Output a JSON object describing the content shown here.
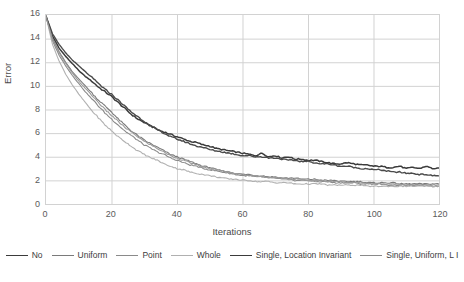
{
  "chart_data": {
    "type": "line",
    "title": "",
    "xlabel": "Iterations",
    "ylabel": "Error",
    "xlim": [
      0,
      120
    ],
    "ylim": [
      0,
      16
    ],
    "xticks": [
      0,
      20,
      40,
      60,
      80,
      100,
      120
    ],
    "yticks": [
      0,
      2,
      4,
      6,
      8,
      10,
      12,
      14,
      16
    ],
    "grid": "horizontal-and-vertical",
    "legend_position": "bottom",
    "x": [
      0,
      2,
      4,
      6,
      8,
      10,
      12,
      14,
      16,
      18,
      20,
      22,
      24,
      26,
      28,
      30,
      32,
      34,
      36,
      38,
      40,
      42,
      44,
      46,
      48,
      50,
      52,
      54,
      56,
      58,
      60,
      62,
      64,
      66,
      68,
      70,
      72,
      74,
      76,
      78,
      80,
      82,
      84,
      86,
      88,
      90,
      92,
      94,
      96,
      98,
      100,
      102,
      104,
      106,
      108,
      110,
      112,
      114,
      116,
      118,
      120
    ],
    "series": [
      {
        "name": "No",
        "color": "#3b3b3b",
        "width": 1.5,
        "values": [
          15.9,
          14.2,
          13.2,
          12.5,
          11.9,
          11.3,
          10.8,
          10.4,
          9.9,
          9.5,
          9.1,
          8.6,
          8.1,
          7.6,
          7.2,
          6.9,
          6.6,
          6.3,
          6.1,
          5.9,
          5.7,
          5.5,
          5.3,
          5.2,
          5.0,
          4.9,
          4.7,
          4.6,
          4.5,
          4.4,
          4.3,
          4.2,
          4.1,
          4.3,
          4.0,
          4.1,
          3.9,
          4.0,
          3.8,
          3.8,
          3.7,
          3.7,
          3.6,
          3.5,
          3.4,
          3.4,
          3.5,
          3.4,
          3.3,
          3.3,
          3.2,
          3.2,
          3.1,
          3.1,
          3.2,
          3.0,
          3.1,
          3.0,
          3.2,
          3.0,
          3.0
        ]
      },
      {
        "name": "Uniform",
        "color": "#7a7a7a",
        "width": 1.1,
        "values": [
          15.9,
          14.0,
          12.9,
          12.0,
          11.2,
          10.6,
          10.0,
          9.4,
          8.8,
          8.3,
          7.8,
          7.2,
          6.7,
          6.2,
          5.8,
          5.4,
          5.1,
          4.8,
          4.5,
          4.2,
          4.0,
          3.8,
          3.6,
          3.4,
          3.2,
          3.1,
          2.9,
          2.8,
          2.7,
          2.6,
          2.5,
          2.5,
          2.4,
          2.4,
          2.3,
          2.3,
          2.2,
          2.2,
          2.2,
          2.1,
          2.1,
          2.1,
          2.0,
          2.0,
          2.0,
          1.9,
          1.9,
          1.9,
          1.9,
          1.8,
          1.8,
          1.8,
          1.8,
          1.8,
          1.7,
          1.7,
          1.7,
          1.7,
          1.7,
          1.7,
          1.7
        ]
      },
      {
        "name": "Point",
        "color": "#8a8a8a",
        "width": 1.1,
        "values": [
          15.9,
          13.8,
          12.6,
          11.7,
          10.9,
          10.2,
          9.5,
          8.9,
          8.3,
          7.7,
          7.2,
          6.7,
          6.2,
          5.8,
          5.4,
          5.0,
          4.7,
          4.4,
          4.2,
          3.9,
          3.7,
          3.5,
          3.3,
          3.2,
          3.0,
          2.9,
          2.8,
          2.7,
          2.6,
          2.5,
          2.4,
          2.4,
          2.3,
          2.3,
          2.2,
          2.2,
          2.1,
          2.1,
          2.0,
          2.0,
          2.0,
          1.9,
          1.9,
          1.9,
          1.8,
          1.8,
          1.8,
          1.8,
          1.7,
          1.7,
          1.7,
          1.7,
          1.6,
          1.6,
          1.6,
          1.6,
          1.6,
          1.6,
          1.6,
          1.5,
          1.5
        ]
      },
      {
        "name": "Whole",
        "color": "#b0b0b0",
        "width": 1.1,
        "values": [
          15.9,
          13.5,
          12.1,
          11.0,
          10.1,
          9.3,
          8.6,
          7.9,
          7.3,
          6.7,
          6.2,
          5.7,
          5.3,
          4.9,
          4.5,
          4.2,
          3.9,
          3.7,
          3.4,
          3.2,
          3.0,
          2.9,
          2.7,
          2.6,
          2.5,
          2.4,
          2.3,
          2.2,
          2.1,
          2.1,
          2.0,
          2.0,
          1.9,
          1.9,
          1.9,
          1.8,
          1.8,
          1.8,
          1.7,
          1.7,
          1.7,
          1.7,
          1.7,
          1.6,
          1.6,
          1.6,
          1.6,
          1.6,
          1.6,
          1.5,
          1.5,
          1.5,
          1.5,
          1.5,
          1.5,
          1.5,
          1.5,
          1.5,
          1.5,
          1.5,
          1.5
        ]
      },
      {
        "name": "Single, Location Invariant",
        "color": "#4a4a4a",
        "width": 1.4,
        "values": [
          15.9,
          14.4,
          13.5,
          12.8,
          12.2,
          11.7,
          11.2,
          10.7,
          10.2,
          9.7,
          9.3,
          8.8,
          8.3,
          7.8,
          7.4,
          7.0,
          6.6,
          6.3,
          6.0,
          5.7,
          5.5,
          5.3,
          5.1,
          4.9,
          4.8,
          4.6,
          4.5,
          4.4,
          4.3,
          4.2,
          4.1,
          4.1,
          4.0,
          4.0,
          3.9,
          3.9,
          3.8,
          3.7,
          3.7,
          3.6,
          3.6,
          3.5,
          3.4,
          3.4,
          3.3,
          3.2,
          3.2,
          3.1,
          3.0,
          3.0,
          2.9,
          2.9,
          2.8,
          2.7,
          2.7,
          2.6,
          2.6,
          2.5,
          2.5,
          2.4,
          2.4
        ]
      },
      {
        "name": "Single, Uniform, L I",
        "color": "#9a9a9a",
        "width": 1.1,
        "values": [
          15.9,
          13.9,
          12.8,
          11.9,
          11.1,
          10.4,
          9.8,
          9.2,
          8.6,
          8.0,
          7.5,
          7.0,
          6.5,
          6.1,
          5.7,
          5.3,
          5.0,
          4.7,
          4.4,
          4.1,
          3.9,
          3.7,
          3.5,
          3.3,
          3.1,
          3.0,
          2.9,
          2.8,
          2.7,
          2.6,
          2.5,
          2.4,
          2.4,
          2.3,
          2.3,
          2.2,
          2.2,
          2.1,
          2.1,
          2.1,
          2.0,
          2.0,
          2.0,
          1.9,
          1.9,
          1.9,
          1.8,
          1.8,
          1.8,
          1.8,
          1.7,
          1.7,
          1.7,
          1.7,
          1.7,
          1.6,
          1.6,
          1.6,
          1.6,
          1.6,
          1.6
        ]
      }
    ]
  },
  "axes": {
    "y_title": "Error",
    "x_title": "Iterations",
    "y_tick_labels": [
      "0",
      "2",
      "4",
      "6",
      "8",
      "10",
      "12",
      "14",
      "16"
    ],
    "x_tick_labels": [
      "0",
      "20",
      "40",
      "60",
      "80",
      "100",
      "120"
    ]
  },
  "legend": {
    "items": [
      {
        "label": "No",
        "color": "#3b3b3b",
        "width": 1.8
      },
      {
        "label": "Uniform",
        "color": "#7a7a7a",
        "width": 1.3
      },
      {
        "label": "Point",
        "color": "#8a8a8a",
        "width": 1.3
      },
      {
        "label": "Whole",
        "color": "#b0b0b0",
        "width": 1.3
      },
      {
        "label": "Single, Location Invariant",
        "color": "#3b3b3b",
        "width": 1.8
      },
      {
        "label": "Single, Uniform, L I",
        "color": "#8a8a8a",
        "width": 1.3
      }
    ]
  },
  "style": {
    "grid_color": "#d2d2d2",
    "axis_text_color": "#5a5a5a",
    "plot_background": "#ffffff"
  }
}
